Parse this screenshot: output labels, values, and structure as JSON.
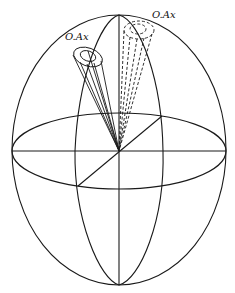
{
  "diagram": {
    "type": "sphere-with-cones",
    "labels": {
      "solid_cone": "O.Ax",
      "dashed_cone": "O.Ax"
    },
    "colors": {
      "stroke": "#1a1a1a",
      "background": "#ffffff"
    }
  }
}
